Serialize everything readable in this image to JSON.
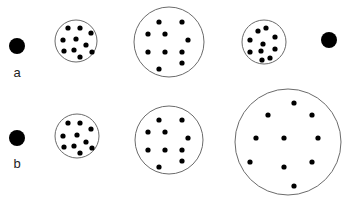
{
  "figure": {
    "width": 347,
    "height": 202,
    "colors": {
      "background": "#ffffff",
      "outline": "#6b6b6b",
      "dot": "#000000",
      "label": "#222222"
    },
    "rows": [
      {
        "label": "a",
        "label_pos": [
          17,
          77
        ],
        "solid_dots": [
          {
            "cx": 17,
            "cy": 46,
            "r": 8
          },
          {
            "cx": 329,
            "cy": 40,
            "r": 8
          }
        ],
        "circles": [
          {
            "cx": 76,
            "cy": 41,
            "r": 21,
            "dots": [
              [
                68,
                28
              ],
              [
                80,
                28
              ],
              [
                91,
                33
              ],
              [
                63,
                40
              ],
              [
                76,
                39
              ],
              [
                86,
                45
              ],
              [
                64,
                51
              ],
              [
                74,
                50
              ],
              [
                92,
                52
              ],
              [
                80,
                57
              ]
            ]
          },
          {
            "cx": 169,
            "cy": 42,
            "r": 35,
            "dots": [
              [
                159,
                22
              ],
              [
                182,
                22
              ],
              [
                148,
                34
              ],
              [
                165,
                34
              ],
              [
                188,
                40
              ],
              [
                148,
                52
              ],
              [
                165,
                52
              ],
              [
                182,
                52
              ],
              [
                182,
                63
              ],
              [
                159,
                69
              ]
            ]
          },
          {
            "cx": 264,
            "cy": 42,
            "r": 22,
            "dots": [
              [
                258,
                31
              ],
              [
                266,
                28
              ],
              [
                250,
                40
              ],
              [
                275,
                37
              ],
              [
                263,
                44
              ],
              [
                250,
                52
              ],
              [
                261,
                51
              ],
              [
                275,
                49
              ],
              [
                262,
                60
              ],
              [
                270,
                58
              ]
            ]
          }
        ]
      },
      {
        "label": "b",
        "label_pos": [
          17,
          168
        ],
        "solid_dots": [
          {
            "cx": 17,
            "cy": 138,
            "r": 8
          }
        ],
        "circles": [
          {
            "cx": 77,
            "cy": 136,
            "r": 22,
            "dots": [
              [
                68,
                123
              ],
              [
                80,
                123
              ],
              [
                91,
                129
              ],
              [
                63,
                136
              ],
              [
                77,
                135
              ],
              [
                86,
                142
              ],
              [
                64,
                147
              ],
              [
                74,
                146
              ],
              [
                92,
                148
              ],
              [
                80,
                153
              ]
            ]
          },
          {
            "cx": 169,
            "cy": 140,
            "r": 34,
            "dots": [
              [
                159,
                120
              ],
              [
                182,
                120
              ],
              [
                148,
                132
              ],
              [
                165,
                132
              ],
              [
                188,
                138
              ],
              [
                148,
                150
              ],
              [
                165,
                150
              ],
              [
                182,
                150
              ],
              [
                182,
                161
              ],
              [
                159,
                167
              ]
            ]
          },
          {
            "cx": 288,
            "cy": 142,
            "r": 53,
            "dots": [
              [
                294,
                103
              ],
              [
                268,
                115
              ],
              [
                312,
                115
              ],
              [
                256,
                138
              ],
              [
                284,
                138
              ],
              [
                318,
                138
              ],
              [
                250,
                162
              ],
              [
                284,
                167
              ],
              [
                312,
                162
              ],
              [
                294,
                186
              ]
            ]
          }
        ]
      }
    ]
  }
}
